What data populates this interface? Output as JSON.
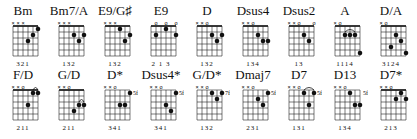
{
  "chords": [
    {
      "name": "Bm",
      "markers": "xxx   ",
      "fret_label": "",
      "dots": [
        [
          4,
          3
        ],
        [
          5,
          2
        ],
        [
          6,
          1
        ]
      ],
      "barre": null,
      "fingers": "321"
    },
    {
      "name": "Bm7/A",
      "markers": "xxx   ",
      "fret_label": "",
      "dots": [
        [
          4,
          2
        ],
        [
          5,
          3
        ],
        [
          6,
          2
        ]
      ],
      "barre": null,
      "fingers": "132"
    },
    {
      "name": "E9/G♯",
      "markers": "xxx   ",
      "fret_label": "",
      "dots": [
        [
          4,
          1
        ],
        [
          5,
          3
        ],
        [
          6,
          2
        ]
      ],
      "barre": null,
      "fingers": "132"
    },
    {
      "name": "E9",
      "markers": " o o o",
      "fret_label": "",
      "dots": [
        [
          2,
          2
        ],
        [
          4,
          1
        ],
        [
          6,
          2
        ]
      ],
      "barre": null,
      "fingers": "2 1 3"
    },
    {
      "name": "D",
      "markers": "xxo   ",
      "fret_label": "",
      "dots": [
        [
          4,
          2
        ],
        [
          5,
          3
        ],
        [
          6,
          2
        ]
      ],
      "barre": null,
      "fingers": "132"
    },
    {
      "name": "Dsus4",
      "markers": "xxo   ",
      "fret_label": "",
      "dots": [
        [
          4,
          2
        ],
        [
          5,
          3
        ],
        [
          6,
          3
        ]
      ],
      "barre": null,
      "fingers": "134"
    },
    {
      "name": "Dsus2",
      "markers": "xxo  o",
      "fret_label": "",
      "dots": [
        [
          4,
          2
        ],
        [
          5,
          3
        ]
      ],
      "barre": null,
      "fingers": "13"
    },
    {
      "name": "A",
      "markers": "xo    ",
      "fret_label": "",
      "dots": [
        [
          3,
          2
        ],
        [
          4,
          2
        ],
        [
          5,
          2
        ],
        [
          6,
          5
        ]
      ],
      "barre": [
        3,
        5,
        2
      ],
      "fingers": "1114"
    },
    {
      "name": "D/A",
      "markers": "xo    ",
      "fret_label": "",
      "dots": [
        [
          3,
          4
        ],
        [
          4,
          2
        ],
        [
          5,
          3
        ],
        [
          6,
          5
        ]
      ],
      "barre": null,
      "fingers": "3124"
    },
    {
      "name": "F/D",
      "markers": "xxo   ",
      "fret_label": "",
      "dots": [
        [
          4,
          3
        ],
        [
          5,
          1
        ],
        [
          6,
          1
        ]
      ],
      "barre": [
        5,
        6,
        1
      ],
      "fingers": "211"
    },
    {
      "name": "G/D",
      "markers": "xxo   ",
      "fret_label": "",
      "dots": [
        [
          4,
          4
        ],
        [
          5,
          3
        ],
        [
          6,
          3
        ]
      ],
      "barre": [
        5,
        6,
        3
      ],
      "fingers": "211"
    },
    {
      "name": "D*",
      "markers": "xxo   ",
      "fret_label": "5fr",
      "dots": [
        [
          4,
          3
        ],
        [
          5,
          3
        ],
        [
          6,
          1
        ]
      ],
      "barre": null,
      "fingers": "341"
    },
    {
      "name": "Dsus4*",
      "markers": "xxo   ",
      "fret_label": "5fr",
      "dots": [
        [
          4,
          3
        ],
        [
          5,
          4
        ],
        [
          6,
          1
        ]
      ],
      "barre": null,
      "fingers": "341"
    },
    {
      "name": "G/D*",
      "markers": "xxo   ",
      "fret_label": "7fr",
      "dots": [
        [
          4,
          1
        ],
        [
          5,
          2
        ],
        [
          6,
          1
        ]
      ],
      "barre": null,
      "fingers": "132"
    },
    {
      "name": "Dmaj7",
      "markers": "xxo   ",
      "fret_label": "5fr",
      "dots": [
        [
          4,
          2
        ],
        [
          5,
          3
        ],
        [
          6,
          1
        ]
      ],
      "barre": null,
      "fingers": "231"
    },
    {
      "name": "D7",
      "markers": "xxo   ",
      "fret_label": "5fr",
      "dots": [
        [
          4,
          1
        ],
        [
          5,
          3
        ],
        [
          6,
          1
        ]
      ],
      "barre": [
        4,
        6,
        1
      ],
      "fingers": "131"
    },
    {
      "name": "D13",
      "markers": "xxo   ",
      "fret_label": "5fr",
      "dots": [
        [
          4,
          1
        ],
        [
          5,
          3
        ],
        [
          6,
          3
        ]
      ],
      "barre": null,
      "fingers": "134"
    },
    {
      "name": "D7*",
      "markers": "xxo   ",
      "fret_label": "",
      "dots": [
        [
          4,
          2
        ],
        [
          5,
          1
        ],
        [
          6,
          2
        ]
      ],
      "barre": null,
      "nut_thick": true,
      "fingers": "213"
    }
  ],
  "layout": {
    "cols": [
      0,
      46,
      92,
      138,
      184,
      230,
      276,
      322,
      368
    ],
    "rows": [
      4,
      68
    ]
  }
}
